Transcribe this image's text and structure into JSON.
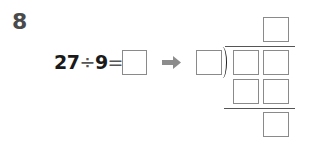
{
  "problem": {
    "number": "8",
    "expression": {
      "dividend": "27",
      "operator": "÷",
      "divisor": "9",
      "equals": "="
    },
    "answer_box": "",
    "arrow_icon": "right-arrow-icon",
    "long_division": {
      "divisor_box": "",
      "quotient_box": "",
      "dividend_boxes": [
        "",
        ""
      ],
      "product_boxes": [
        "",
        ""
      ],
      "remainder_box": ""
    }
  },
  "colors": {
    "text": "#1a1a1a",
    "number": "#4a4a4a",
    "box_border": "#8a8a8a",
    "arrow": "#8c8c8c"
  }
}
